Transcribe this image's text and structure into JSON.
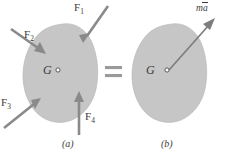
{
  "figure": {
    "background_color": "#ffffff",
    "body_fill_color": "#c6c6c6",
    "arrow_color": "#8a8a8a",
    "label_color": "#3b3b3b"
  },
  "panel_a": {
    "caption": "(a)",
    "center_of_mass_label": "G",
    "forces": [
      {
        "name": "F1",
        "label": "F",
        "subscript": "1",
        "direction": "down-left",
        "angle_deg": 235
      },
      {
        "name": "F2",
        "label": "F",
        "subscript": "2",
        "direction": "down-right",
        "angle_deg": 325
      },
      {
        "name": "F3",
        "label": "F",
        "subscript": "3",
        "direction": "up-right",
        "angle_deg": 40
      },
      {
        "name": "F4",
        "label": "F",
        "subscript": "4",
        "direction": "up",
        "angle_deg": 90
      }
    ]
  },
  "equals": {
    "symbol": "="
  },
  "panel_b": {
    "caption": "(b)",
    "center_of_mass_label": "G",
    "resultant": {
      "name": "ma-vector",
      "mass_symbol": "m",
      "accel_symbol": "a",
      "notation": "vector-overbar",
      "label_text": "ma",
      "direction": "up-right",
      "angle_deg": 40,
      "origin": "G"
    }
  }
}
